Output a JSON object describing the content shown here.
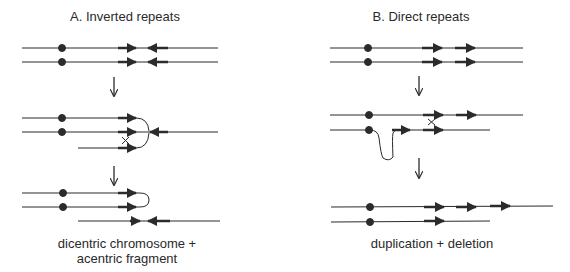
{
  "panel_a": {
    "title": "A. Inverted repeats",
    "result_line1": "dicentric chromosome +",
    "result_line2": "acentric fragment",
    "crossover_mark": "×"
  },
  "panel_b": {
    "title": "B. Direct repeats",
    "result": "duplication + deletion",
    "crossover_mark": "×"
  },
  "colors": {
    "line": "#2b2b2b",
    "text": "#2a2a2a",
    "background": "#ffffff"
  }
}
